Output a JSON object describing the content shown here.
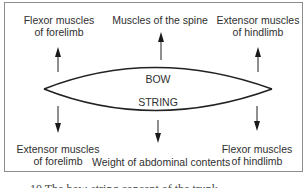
{
  "diagram": {
    "center": {
      "bow_label": "BOW",
      "string_label": "STRING"
    },
    "top_labels": [
      {
        "line1": "Flexor muscles",
        "line2": "of forelimb",
        "arrow": "up"
      },
      {
        "line1": "Muscles of the spine",
        "line2": "",
        "arrow": "up"
      },
      {
        "line1": "Extensor muscles",
        "line2": "of hindlimb",
        "arrow": "up"
      }
    ],
    "bottom_labels": [
      {
        "line1": "Extensor muscles",
        "line2": "of forelimb",
        "arrow": "down"
      },
      {
        "line1": "Weight of abdominal contents",
        "line2": "",
        "arrow": "down"
      },
      {
        "line1": "Flexor muscles",
        "line2": "of hindlimb",
        "arrow": "down"
      }
    ],
    "caption": "10 The bow-string concept of the trunk"
  }
}
